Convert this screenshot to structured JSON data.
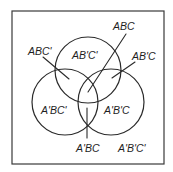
{
  "diagram": {
    "type": "venn",
    "sets": [
      "A",
      "B",
      "C"
    ],
    "frame": {
      "x": 12,
      "y": 11,
      "width": 152,
      "height": 153
    },
    "circles": [
      {
        "name": "circle-A",
        "cx": 88,
        "cy": 70,
        "r": 33
      },
      {
        "name": "circle-B",
        "cx": 65,
        "cy": 102,
        "r": 33
      },
      {
        "name": "circle-C",
        "cx": 111,
        "cy": 102,
        "r": 33
      }
    ],
    "labels": {
      "abc_prime": "ABC'",
      "ab_prime_c_prime": "AB'C'",
      "abc": "ABC",
      "ab_prime_c": "AB'C",
      "a_prime_bc_prime": "A'BC'",
      "a_prime_b_prime_c": "A'B'C",
      "a_prime_bc": "A'BC",
      "a_prime_b_prime_c_prime": "A'B'C'"
    },
    "colors": {
      "stroke": "#2a2a2a",
      "text": "#1e1e1e",
      "background": "#ffffff"
    }
  }
}
